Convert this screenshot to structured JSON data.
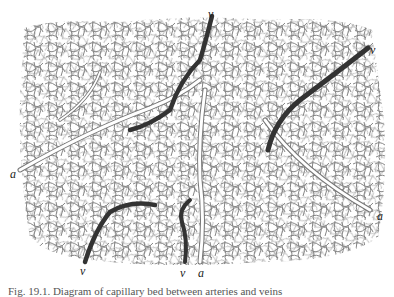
{
  "figure": {
    "caption": "Fig. 19.1. Diagram of capillary bed between arteries and veins",
    "labels": [
      {
        "id": "v-top",
        "text": "v",
        "x": 208,
        "y": 8
      },
      {
        "id": "v-right",
        "text": "v",
        "x": 370,
        "y": 44
      },
      {
        "id": "a-left",
        "text": "a",
        "x": 10,
        "y": 168
      },
      {
        "id": "a-right",
        "text": "a",
        "x": 377,
        "y": 210
      },
      {
        "id": "v-bottom-left",
        "text": "v",
        "x": 80,
        "y": 265
      },
      {
        "id": "v-bottom-mid",
        "text": "v",
        "x": 180,
        "y": 267
      },
      {
        "id": "a-bottom",
        "text": "a",
        "x": 198,
        "y": 267
      }
    ],
    "colors": {
      "capillary": "#6a6a6a",
      "vein": "#2e2e2e",
      "artery_outline": "#777777",
      "background": "#ffffff"
    }
  }
}
